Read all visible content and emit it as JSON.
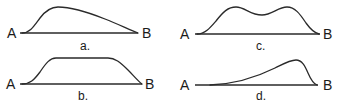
{
  "diagram": {
    "panels": [
      {
        "id": "a",
        "caption": "a.",
        "start_label": "A",
        "end_label": "B",
        "shape": "early peak with long gradual decline",
        "geom": {
          "baseline": [
            20,
            33,
            138,
            33
          ],
          "start_label_pos": [
            13,
            38
          ],
          "end_label_pos": [
            148,
            38
          ],
          "caption_pos": [
            84,
            50
          ],
          "path": "M22,33 C30,33 34,26 40,18 C46,10 52,7 58,7 C70,7 90,13 105,19 C118,24 130,30 138,33"
        }
      },
      {
        "id": "b",
        "caption": "b.",
        "start_label": "A",
        "end_label": "B",
        "shape": "flat plateau",
        "geom": {
          "baseline": [
            20,
            84,
            142,
            84
          ],
          "start_label_pos": [
            12,
            89
          ],
          "end_label_pos": [
            148,
            89
          ],
          "caption_pos": [
            82,
            100
          ],
          "path": "M22,84 C30,84 34,80 40,72 C46,63 50,58 56,58 L108,58 C115,58 120,62 128,70 C134,76 138,81 142,84"
        }
      },
      {
        "id": "c",
        "caption": "c.",
        "start_label": "A",
        "end_label": "B",
        "shape": "two peaks with a dip between",
        "geom": {
          "baseline": [
            195,
            34,
            320,
            34
          ],
          "start_label_pos": [
            184,
            39
          ],
          "end_label_pos": [
            328,
            39
          ],
          "caption_pos": [
            259,
            50
          ],
          "path": "M197,34 C205,34 210,28 216,21 C223,12 228,7 236,7 C245,7 250,15 262,15 C272,15 278,7 287,7 C295,7 300,14 306,23 C311,30 315,33 319,34"
        }
      },
      {
        "id": "d",
        "caption": "d.",
        "start_label": "A",
        "end_label": "B",
        "shape": "late peak with gradual rise and steep fall",
        "geom": {
          "baseline": [
            195,
            85,
            318,
            85
          ],
          "start_label_pos": [
            184,
            90
          ],
          "end_label_pos": [
            328,
            90
          ],
          "caption_pos": [
            259,
            100
          ],
          "path": "M210,85 C235,84 255,78 275,68 C285,63 290,60 296,60 C302,60 305,66 308,73 C311,80 314,84 317,85"
        }
      }
    ]
  }
}
